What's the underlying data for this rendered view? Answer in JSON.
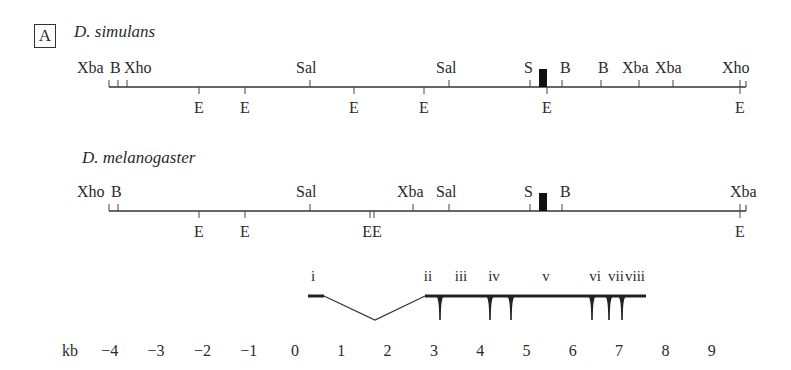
{
  "panel_label": "A",
  "maps": [
    {
      "species": "D. simulans",
      "line": {
        "x1": 109,
        "x2": 746,
        "y": 87
      },
      "top_sites": [
        {
          "label": "Xba",
          "x": 109
        },
        {
          "label": "B",
          "x": 118
        },
        {
          "label": "Xho",
          "x": 127
        },
        {
          "label": "Sal",
          "x": 310
        },
        {
          "label": "Sal",
          "x": 449
        },
        {
          "label": "S",
          "x": 530
        },
        {
          "label": "B",
          "x": 562
        },
        {
          "label": "B",
          "x": 601
        },
        {
          "label": "Xba",
          "x": 639
        },
        {
          "label": "Xba",
          "x": 673
        },
        {
          "label": "Xho",
          "x": 740
        }
      ],
      "top_label_positions": [
        {
          "text": "Xba",
          "x": 77
        },
        {
          "text": "B",
          "x": 110
        },
        {
          "text": "Xho",
          "x": 124
        },
        {
          "text": "Sal",
          "x": 296
        },
        {
          "text": "Sal",
          "x": 436
        },
        {
          "text": "S",
          "x": 524
        },
        {
          "text": "B",
          "x": 560
        },
        {
          "text": "B",
          "x": 598
        },
        {
          "text": "Xba",
          "x": 622
        },
        {
          "text": "Xba",
          "x": 655
        },
        {
          "text": "Xho",
          "x": 722
        }
      ],
      "bottom_sites": [
        {
          "label": "E",
          "x": 199
        },
        {
          "label": "E",
          "x": 245
        },
        {
          "label": "E",
          "x": 354
        },
        {
          "label": "E",
          "x": 424
        },
        {
          "label": "E",
          "x": 547
        },
        {
          "label": "E",
          "x": 740
        }
      ],
      "gene_box": {
        "x": 539,
        "width": 8,
        "height": 18
      }
    },
    {
      "species": "D. melanogaster",
      "line": {
        "x1": 109,
        "x2": 746,
        "y": 211
      },
      "top_sites": [
        {
          "label": "Xho",
          "x": 109
        },
        {
          "label": "B",
          "x": 118
        },
        {
          "label": "Sal",
          "x": 310
        },
        {
          "label": "Xba",
          "x": 413
        },
        {
          "label": "Sal",
          "x": 449
        },
        {
          "label": "S",
          "x": 530
        },
        {
          "label": "B",
          "x": 562
        },
        {
          "label": "Xba",
          "x": 740
        }
      ],
      "top_label_positions": [
        {
          "text": "Xho",
          "x": 77
        },
        {
          "text": "B",
          "x": 111
        },
        {
          "text": "Sal",
          "x": 296
        },
        {
          "text": "Xba",
          "x": 397
        },
        {
          "text": "Sal",
          "x": 436
        },
        {
          "text": "S",
          "x": 524
        },
        {
          "text": "B",
          "x": 560
        },
        {
          "text": "Xba",
          "x": 730
        }
      ],
      "bottom_sites": [
        {
          "label": "E",
          "x": 199
        },
        {
          "label": "E",
          "x": 245
        },
        {
          "label": "E",
          "x": 370
        },
        {
          "label": "E",
          "x": 374
        },
        {
          "label": "E",
          "x": 740
        }
      ],
      "bottom_label_positions": [
        {
          "text": "E",
          "x": 199
        },
        {
          "text": "E",
          "x": 245
        },
        {
          "text": "EE",
          "x": 372
        },
        {
          "text": "E",
          "x": 740
        }
      ],
      "gene_box": {
        "x": 539,
        "width": 8,
        "height": 18
      }
    }
  ],
  "gene_model": {
    "exon_labels": [
      {
        "text": "i",
        "x": 313
      },
      {
        "text": "ii",
        "x": 428
      },
      {
        "text": "iii",
        "x": 461
      },
      {
        "text": "iv",
        "x": 494
      },
      {
        "text": "v",
        "x": 546
      },
      {
        "text": "vi",
        "x": 595
      },
      {
        "text": "vii",
        "x": 616
      },
      {
        "text": "viii",
        "x": 635
      }
    ],
    "intron_dips_x": [
      440,
      490,
      511,
      592,
      609,
      622
    ]
  },
  "scale": {
    "unit": "kb",
    "ticks": [
      "-4",
      "-3",
      "-2",
      "-1",
      "0",
      "1",
      "2",
      "3",
      "4",
      "5",
      "6",
      "7",
      "8",
      "9"
    ],
    "origin_x": 295,
    "px_per_kb": 46.3
  }
}
